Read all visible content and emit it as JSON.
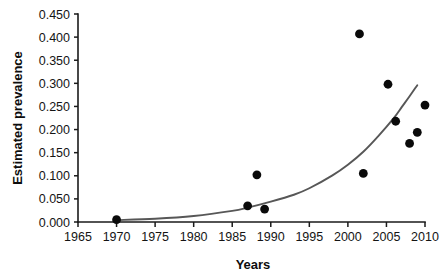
{
  "chart_data": {
    "type": "scatter",
    "title": "",
    "subtitle": "",
    "xlabel": "Years",
    "ylabel": "Estimated prevalence",
    "xlim": [
      1965,
      2010
    ],
    "ylim": [
      0.0,
      0.45
    ],
    "grid": false,
    "legend": false,
    "legend_position": "none",
    "x_ticks": [
      1965,
      1970,
      1975,
      1980,
      1985,
      1990,
      1995,
      2000,
      2005,
      2010
    ],
    "x_tick_labels": [
      "1965",
      "1970",
      "1975",
      "1980",
      "1985",
      "1990",
      "1995",
      "2000",
      "2005",
      "2010"
    ],
    "y_ticks": [
      0.0,
      0.05,
      0.1,
      0.15,
      0.2,
      0.25,
      0.3,
      0.35,
      0.4,
      0.45
    ],
    "y_tick_labels": [
      "0.000",
      "0.050",
      "0.100",
      "0.150",
      "0.200",
      "0.250",
      "0.300",
      "0.350",
      "0.400",
      "0.450"
    ],
    "series": [
      {
        "name": "Observed prevalence",
        "type": "scatter",
        "marker": "circle",
        "color": "#0a0a0a",
        "points": [
          {
            "x": 1970,
            "y": 0.005
          },
          {
            "x": 1987,
            "y": 0.035
          },
          {
            "x": 1988.2,
            "y": 0.102
          },
          {
            "x": 1989.2,
            "y": 0.028
          },
          {
            "x": 2001.5,
            "y": 0.407
          },
          {
            "x": 2002,
            "y": 0.105
          },
          {
            "x": 2005.2,
            "y": 0.298
          },
          {
            "x": 2006.2,
            "y": 0.218
          },
          {
            "x": 2008,
            "y": 0.17
          },
          {
            "x": 2009,
            "y": 0.194
          },
          {
            "x": 2010,
            "y": 0.253
          }
        ]
      },
      {
        "name": "Exponential fit",
        "type": "line",
        "color": "#575757",
        "points": [
          {
            "x": 1970,
            "y": 0.004
          },
          {
            "x": 1975,
            "y": 0.007
          },
          {
            "x": 1980,
            "y": 0.013
          },
          {
            "x": 1985,
            "y": 0.024
          },
          {
            "x": 1987,
            "y": 0.031
          },
          {
            "x": 1990,
            "y": 0.044
          },
          {
            "x": 1993,
            "y": 0.059
          },
          {
            "x": 1995,
            "y": 0.073
          },
          {
            "x": 1998,
            "y": 0.101
          },
          {
            "x": 2000,
            "y": 0.124
          },
          {
            "x": 2002,
            "y": 0.152
          },
          {
            "x": 2004,
            "y": 0.187
          },
          {
            "x": 2006,
            "y": 0.226
          },
          {
            "x": 2007,
            "y": 0.249
          },
          {
            "x": 2008,
            "y": 0.272
          },
          {
            "x": 2009,
            "y": 0.296
          }
        ]
      }
    ]
  },
  "axes": {
    "x_title": "Years",
    "y_title": "Estimated prevalence"
  }
}
